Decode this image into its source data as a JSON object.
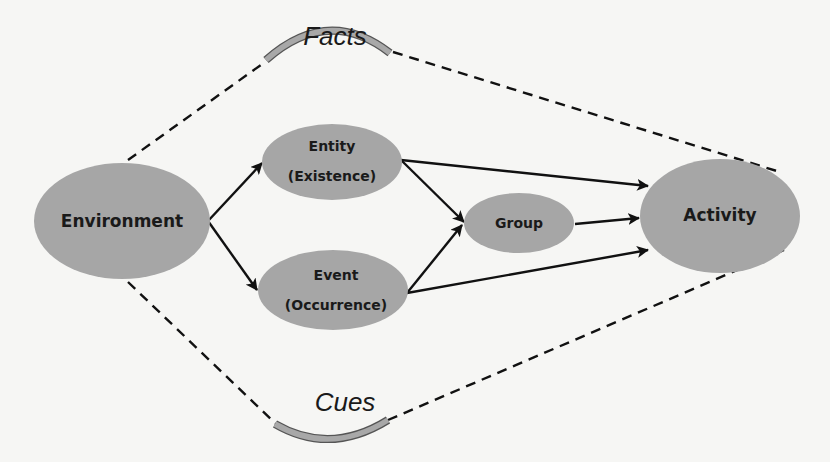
{
  "diagram": {
    "arcs": {
      "top": {
        "label": "Facts"
      },
      "bottom": {
        "label": "Cues"
      }
    },
    "nodes": {
      "environment": {
        "label": "Environment"
      },
      "entity": {
        "line1": "Entity",
        "line2": "(Existence)"
      },
      "event": {
        "line1": "Event",
        "line2": "(Occurrence)"
      },
      "group": {
        "label": "Group"
      },
      "activity": {
        "label": "Activity"
      }
    },
    "edges": [
      {
        "from": "Environment",
        "to": "Entity (Existence)"
      },
      {
        "from": "Environment",
        "to": "Event (Occurrence)"
      },
      {
        "from": "Entity (Existence)",
        "to": "Group"
      },
      {
        "from": "Entity (Existence)",
        "to": "Activity"
      },
      {
        "from": "Event (Occurrence)",
        "to": "Group"
      },
      {
        "from": "Event (Occurrence)",
        "to": "Activity"
      },
      {
        "from": "Group",
        "to": "Activity"
      }
    ],
    "colors": {
      "node_fill": "#a6a6a6",
      "background": "#f6f6f4",
      "stroke": "#111111"
    }
  }
}
